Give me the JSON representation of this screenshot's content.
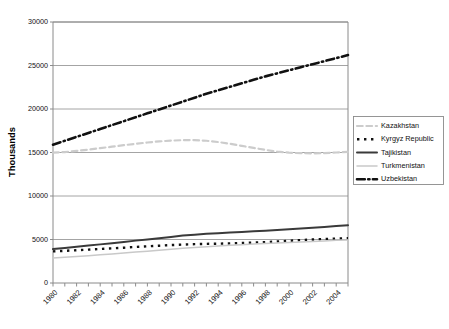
{
  "chart_data": {
    "type": "line",
    "title": "",
    "subtitle": "",
    "xlabel": "",
    "ylabel": "Thousands",
    "xlim": [
      1980,
      2005
    ],
    "ylim": [
      0,
      30000
    ],
    "grid": "horizontal",
    "legend_position": "right",
    "y_ticks": [
      0,
      5000,
      10000,
      15000,
      20000,
      25000,
      30000
    ],
    "y_tick_labels": [
      "0",
      "5000",
      "10000",
      "15000",
      "20000",
      "25000",
      "30000"
    ],
    "x_ticks": [
      1980,
      1981,
      1982,
      1983,
      1984,
      1985,
      1986,
      1987,
      1988,
      1989,
      1990,
      1991,
      1992,
      1993,
      1994,
      1995,
      1996,
      1997,
      1998,
      1999,
      2000,
      2001,
      2002,
      2003,
      2004,
      2005
    ],
    "x_tick_labels": [
      "1980",
      "1982",
      "1984",
      "1986",
      "1988",
      "1990",
      "1992",
      "1994",
      "1996",
      "1998",
      "2000",
      "2002",
      "2004"
    ],
    "x_labeled_ticks": [
      1980,
      1982,
      1984,
      1986,
      1988,
      1990,
      1992,
      1994,
      1996,
      1998,
      2000,
      2002,
      2004
    ],
    "x": [
      1980,
      1981,
      1982,
      1983,
      1984,
      1985,
      1986,
      1987,
      1988,
      1989,
      1990,
      1991,
      1992,
      1993,
      1994,
      1995,
      1996,
      1997,
      1998,
      1999,
      2000,
      2001,
      2002,
      2003,
      2004,
      2005
    ],
    "series": [
      {
        "name": "Kazakhstan",
        "color": "#cccccc",
        "style": "dashed",
        "width": 2.2,
        "values": [
          14990,
          15050,
          15180,
          15330,
          15500,
          15670,
          15840,
          16000,
          16150,
          16280,
          16360,
          16420,
          16430,
          16350,
          16200,
          16000,
          15760,
          15530,
          15300,
          15100,
          14980,
          14920,
          14900,
          14930,
          15000,
          15080
        ]
      },
      {
        "name": "Kyrgyz Republic",
        "color": "#111111",
        "style": "dotted",
        "width": 2.4,
        "values": [
          3630,
          3700,
          3770,
          3840,
          3910,
          3980,
          4060,
          4140,
          4220,
          4290,
          4360,
          4420,
          4470,
          4500,
          4520,
          4550,
          4590,
          4640,
          4700,
          4770,
          4850,
          4930,
          5000,
          5060,
          5110,
          5140
        ]
      },
      {
        "name": "Tajikistan",
        "color": "#3a3a3a",
        "style": "solid",
        "width": 2.0,
        "values": [
          3900,
          4030,
          4160,
          4300,
          4440,
          4580,
          4720,
          4870,
          5010,
          5150,
          5300,
          5450,
          5560,
          5650,
          5730,
          5800,
          5870,
          5940,
          6010,
          6090,
          6170,
          6260,
          6350,
          6440,
          6540,
          6640
        ]
      },
      {
        "name": "Turkmenistan",
        "color": "#c9c9c9",
        "style": "solid",
        "width": 1.5,
        "values": [
          2880,
          2960,
          3050,
          3140,
          3240,
          3340,
          3440,
          3550,
          3660,
          3770,
          3880,
          3980,
          4080,
          4170,
          4250,
          4330,
          4400,
          4470,
          4540,
          4600,
          4660,
          4720,
          4780,
          4840,
          4900,
          4950
        ]
      },
      {
        "name": "Uzbekistan",
        "color": "#111111",
        "style": "dashdot",
        "width": 2.6,
        "values": [
          15900,
          16350,
          16800,
          17250,
          17700,
          18150,
          18600,
          19050,
          19500,
          19950,
          20400,
          20850,
          21300,
          21750,
          22150,
          22550,
          22950,
          23350,
          23750,
          24100,
          24450,
          24800,
          25150,
          25500,
          25850,
          26200
        ]
      }
    ]
  },
  "legend": {
    "entries": [
      {
        "label": "Kazakhstan"
      },
      {
        "label": "Kyrgyz Republic"
      },
      {
        "label": "Tajikistan"
      },
      {
        "label": "Turkmenistan"
      },
      {
        "label": "Uzbekistan"
      }
    ]
  }
}
